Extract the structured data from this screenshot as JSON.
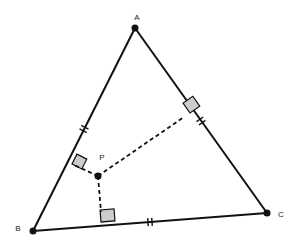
{
  "diagram": {
    "type": "geometry",
    "points": {
      "A": {
        "label": "A",
        "x": 135,
        "y": 28
      },
      "B": {
        "label": "B",
        "x": 33,
        "y": 231
      },
      "C": {
        "label": "C",
        "x": 267,
        "y": 213
      },
      "P": {
        "label": "P",
        "x": 98,
        "y": 176
      }
    },
    "sides": [
      "AB",
      "BC",
      "CA"
    ],
    "perpendicular_feet": {
      "AB": {
        "x": 72,
        "y": 164
      },
      "BC": {
        "x": 101,
        "y": 222
      },
      "CA": {
        "x": 190,
        "y": 113
      }
    },
    "tick_marks": {
      "AB": 2,
      "BC": 2,
      "CA": 2
    },
    "right_angle_fill": "#cccccc",
    "line_color": "#111111"
  }
}
